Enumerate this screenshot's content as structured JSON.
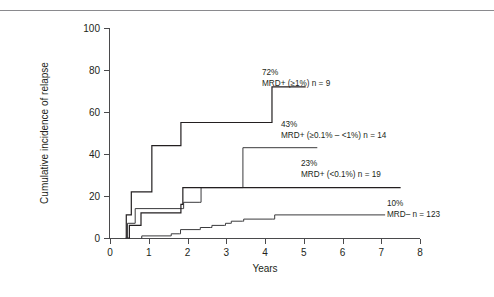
{
  "figure": {
    "background": "#ffffff",
    "line_color": "#231f20",
    "axis_color": "#4a4a4c",
    "rule_color": "#8a8a8e"
  },
  "chart_data": {
    "type": "line",
    "subtype": "step",
    "title": "",
    "xlabel": "Years",
    "ylabel": "Cumulative incidence of relapse",
    "xlim": [
      0,
      8
    ],
    "ylim": [
      0,
      100
    ],
    "xticks": [
      0,
      1,
      2,
      3,
      4,
      5,
      6,
      7,
      8
    ],
    "xticklabels": [
      "0",
      "1",
      "2",
      "3",
      "4",
      "5",
      "6",
      "7",
      "8"
    ],
    "yticks": [
      0,
      20,
      40,
      60,
      80,
      100
    ],
    "yticklabels": [
      "0",
      "20",
      "40",
      "60",
      "80",
      "100"
    ],
    "grid": false,
    "legend": "annotations-inline",
    "series": [
      {
        "name": "MRD+ (≥1%)",
        "label_pct": "72%",
        "label_group": "MRD+ (≥1%) n = 9",
        "n": 9,
        "final_value": 72,
        "points": [
          [
            0.4,
            0
          ],
          [
            0.42,
            11
          ],
          [
            0.52,
            11
          ],
          [
            0.55,
            22
          ],
          [
            1.05,
            22
          ],
          [
            1.08,
            44
          ],
          [
            1.8,
            44
          ],
          [
            1.83,
            55
          ],
          [
            4.15,
            55
          ],
          [
            4.18,
            72
          ],
          [
            5.05,
            72
          ]
        ]
      },
      {
        "name": "MRD+ (≥0.1% – <1%)",
        "label_pct": "43%",
        "label_group": "MRD+ (≥0.1% – <1%) n = 14",
        "n": 14,
        "final_value": 43,
        "points": [
          [
            0.42,
            0
          ],
          [
            0.45,
            7
          ],
          [
            0.62,
            7
          ],
          [
            0.65,
            14
          ],
          [
            1.88,
            14
          ],
          [
            1.9,
            17
          ],
          [
            2.32,
            17
          ],
          [
            2.35,
            24
          ],
          [
            3.4,
            24
          ],
          [
            3.43,
            43
          ],
          [
            5.35,
            43
          ]
        ]
      },
      {
        "name": "MRD+ (<0.1%)",
        "label_pct": "23%",
        "label_group": "MRD+ (<0.1%) n = 19",
        "n": 19,
        "final_value": 23,
        "points": [
          [
            0.45,
            0
          ],
          [
            0.5,
            6
          ],
          [
            0.78,
            6
          ],
          [
            0.8,
            12
          ],
          [
            1.8,
            12
          ],
          [
            1.83,
            16
          ],
          [
            1.88,
            24
          ],
          [
            7.5,
            24
          ]
        ]
      },
      {
        "name": "MRD–",
        "label_pct": "10%",
        "label_group": "MRD–  n = 123",
        "n": 123,
        "final_value": 10,
        "points": [
          [
            0.8,
            0
          ],
          [
            0.82,
            1
          ],
          [
            1.55,
            1
          ],
          [
            1.58,
            2
          ],
          [
            1.8,
            2
          ],
          [
            1.82,
            4
          ],
          [
            2.3,
            4
          ],
          [
            2.33,
            5
          ],
          [
            2.6,
            5
          ],
          [
            2.63,
            6
          ],
          [
            2.95,
            6
          ],
          [
            2.98,
            7
          ],
          [
            3.1,
            7
          ],
          [
            3.13,
            8
          ],
          [
            3.42,
            8
          ],
          [
            3.45,
            9
          ],
          [
            4.2,
            9
          ],
          [
            4.25,
            11
          ],
          [
            7.1,
            11
          ]
        ]
      }
    ],
    "annotations": [
      {
        "id": "annot-mrd-high",
        "pct": "72%",
        "group": "MRD+ (≥1%) n = 9",
        "x_px": 262,
        "y_px": 75
      },
      {
        "id": "annot-mrd-mid",
        "pct": "43%",
        "group": "MRD+ (≥0.1% – <1%) n = 14",
        "x_px": 281,
        "y_px": 127
      },
      {
        "id": "annot-mrd-low",
        "pct": "23%",
        "group": "MRD+ (<0.1%) n = 19",
        "x_px": 301,
        "y_px": 166
      },
      {
        "id": "annot-mrd-neg",
        "pct": "10%",
        "group": "MRD–  n = 123",
        "x_px": 387,
        "y_px": 206
      }
    ]
  }
}
